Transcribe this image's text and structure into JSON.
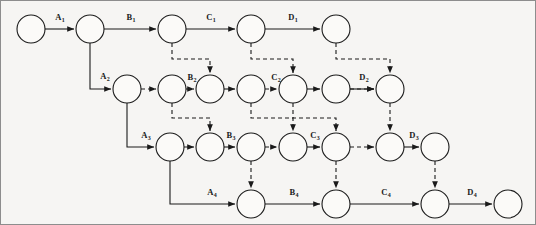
{
  "figure": {
    "title": "",
    "background_color": "#f6f5f3",
    "ink_color": "#1a1a1a",
    "frame_color": "#8d8d8d",
    "node_radius": 14,
    "node_fill": "#fbfaf8"
  },
  "chart_data": {
    "type": "diagram",
    "subtype": "activity-on-arrow network / pipeline flow-shop schedule graph",
    "title": "",
    "xlabel": "",
    "ylabel": "",
    "grid": false,
    "legend": "none",
    "rows": 4,
    "row_y": [
      29,
      89,
      147,
      204
    ],
    "nodes": [
      {
        "id": "n1-1",
        "row": 1,
        "x": 31,
        "y": 29
      },
      {
        "id": "n1-2",
        "row": 1,
        "x": 90,
        "y": 29
      },
      {
        "id": "n1-3",
        "row": 1,
        "x": 172,
        "y": 29
      },
      {
        "id": "n1-4",
        "row": 1,
        "x": 251,
        "y": 29
      },
      {
        "id": "n1-5",
        "row": 1,
        "x": 336,
        "y": 29
      },
      {
        "id": "n2-1",
        "row": 2,
        "x": 127,
        "y": 89
      },
      {
        "id": "n2-2",
        "row": 2,
        "x": 172,
        "y": 89
      },
      {
        "id": "n2-3",
        "row": 2,
        "x": 210,
        "y": 89
      },
      {
        "id": "n2-4",
        "row": 2,
        "x": 251,
        "y": 89
      },
      {
        "id": "n2-5",
        "row": 2,
        "x": 293,
        "y": 89
      },
      {
        "id": "n2-6",
        "row": 2,
        "x": 336,
        "y": 89
      },
      {
        "id": "n2-7",
        "row": 2,
        "x": 390,
        "y": 89
      },
      {
        "id": "n3-1",
        "row": 3,
        "x": 170,
        "y": 147
      },
      {
        "id": "n3-2",
        "row": 3,
        "x": 210,
        "y": 147
      },
      {
        "id": "n3-3",
        "row": 3,
        "x": 251,
        "y": 147
      },
      {
        "id": "n3-4",
        "row": 3,
        "x": 293,
        "y": 147
      },
      {
        "id": "n3-5",
        "row": 3,
        "x": 336,
        "y": 147
      },
      {
        "id": "n3-6",
        "row": 3,
        "x": 390,
        "y": 147
      },
      {
        "id": "n3-7",
        "row": 3,
        "x": 435,
        "y": 147
      },
      {
        "id": "n4-1",
        "row": 4,
        "x": 251,
        "y": 204
      },
      {
        "id": "n4-2",
        "row": 4,
        "x": 336,
        "y": 204
      },
      {
        "id": "n4-3",
        "row": 4,
        "x": 435,
        "y": 204
      },
      {
        "id": "n4-4",
        "row": 4,
        "x": 508,
        "y": 204
      }
    ],
    "solid_edges": [
      {
        "label": "A1",
        "from": "n1-1",
        "to": "n1-2",
        "label_x": 60,
        "label_y": 20
      },
      {
        "label": "B1",
        "from": "n1-2",
        "to": "n1-3",
        "label_x": 131,
        "label_y": 20
      },
      {
        "label": "C1",
        "from": "n1-3",
        "to": "n1-4",
        "label_x": 211,
        "label_y": 20
      },
      {
        "label": "D1",
        "from": "n1-4",
        "to": "n1-5",
        "label_x": 293,
        "label_y": 20
      },
      {
        "label": "A2",
        "from": "n1-2",
        "to": "n2-1",
        "label_x": 105,
        "label_y": 79,
        "elbow": true
      },
      {
        "label": "B2",
        "from": "n2-3",
        "to": "n2-4",
        "label_x": 192,
        "label_y": 80
      },
      {
        "label": "C2",
        "from": "n2-5",
        "to": "n2-6",
        "label_x": 276,
        "label_y": 80
      },
      {
        "label": "D2",
        "from": "n2-6",
        "to": "n2-7",
        "label_x": 364,
        "label_y": 80
      },
      {
        "label": "A3",
        "from": "n2-1",
        "to": "n3-1",
        "label_x": 146,
        "label_y": 138,
        "elbow": true
      },
      {
        "label": "B3",
        "from": "n3-2",
        "to": "n3-3",
        "label_x": 231,
        "label_y": 138
      },
      {
        "label": "C3",
        "from": "n3-4",
        "to": "n3-5",
        "label_x": 315,
        "label_y": 138
      },
      {
        "label": "D3",
        "from": "n3-6",
        "to": "n3-7",
        "label_x": 414,
        "label_y": 138
      },
      {
        "label": "A4",
        "from": "n3-1",
        "to": "n4-1",
        "label_x": 212,
        "label_y": 195,
        "elbow": true
      },
      {
        "label": "B4",
        "from": "n4-1",
        "to": "n4-2",
        "label_x": 294,
        "label_y": 195
      },
      {
        "label": "C4",
        "from": "n4-2",
        "to": "n4-3",
        "label_x": 386,
        "label_y": 195
      },
      {
        "label": "D4",
        "from": "n4-3",
        "to": "n4-4",
        "label_x": 472,
        "label_y": 195
      }
    ],
    "dashed_edges": [
      {
        "from": "n1-3",
        "to": "n2-3",
        "orientation": "vertical"
      },
      {
        "from": "n1-4",
        "to": "n2-5",
        "orientation": "vertical"
      },
      {
        "from": "n1-5",
        "to": "n2-7",
        "orientation": "vertical"
      },
      {
        "from": "n2-1",
        "to": "n2-2",
        "orientation": "horizontal"
      },
      {
        "from": "n2-2",
        "to": "n2-3",
        "orientation": "horizontal"
      },
      {
        "from": "n2-4",
        "to": "n2-5",
        "orientation": "horizontal"
      },
      {
        "from": "n2-6",
        "to": "n2-7",
        "orientation": "horizontal"
      },
      {
        "from": "n2-2",
        "to": "n3-2",
        "orientation": "vertical"
      },
      {
        "from": "n2-4",
        "to": "n3-4",
        "orientation": "vertical"
      },
      {
        "from": "n2-5",
        "to": "n3-5",
        "orientation": "vertical"
      },
      {
        "from": "n2-7",
        "to": "n3-6",
        "orientation": "vertical"
      },
      {
        "from": "n3-1",
        "to": "n3-2",
        "orientation": "horizontal"
      },
      {
        "from": "n3-3",
        "to": "n3-4",
        "orientation": "horizontal"
      },
      {
        "from": "n3-5",
        "to": "n3-6",
        "orientation": "horizontal"
      },
      {
        "from": "n3-3",
        "to": "n4-1",
        "orientation": "vertical"
      },
      {
        "from": "n3-5",
        "to": "n4-2",
        "orientation": "vertical"
      },
      {
        "from": "n3-7",
        "to": "n4-3",
        "orientation": "vertical"
      }
    ],
    "labels": [
      "A1",
      "B1",
      "C1",
      "D1",
      "A2",
      "B2",
      "C2",
      "D2",
      "A3",
      "B3",
      "C3",
      "D3",
      "A4",
      "B4",
      "C4",
      "D4"
    ],
    "label_text": {
      "A1": {
        "base": "A",
        "sub": "1"
      },
      "B1": {
        "base": "B",
        "sub": "1"
      },
      "C1": {
        "base": "C",
        "sub": "1"
      },
      "D1": {
        "base": "D",
        "sub": "1"
      },
      "A2": {
        "base": "A",
        "sub": "2"
      },
      "B2": {
        "base": "B",
        "sub": "2"
      },
      "C2": {
        "base": "C",
        "sub": "2"
      },
      "D2": {
        "base": "D",
        "sub": "2"
      },
      "A3": {
        "base": "A",
        "sub": "3"
      },
      "B3": {
        "base": "B",
        "sub": "3"
      },
      "C3": {
        "base": "C",
        "sub": "3"
      },
      "D3": {
        "base": "D",
        "sub": "3"
      },
      "A4": {
        "base": "A",
        "sub": "4"
      },
      "B4": {
        "base": "B",
        "sub": "4"
      },
      "C4": {
        "base": "C",
        "sub": "4"
      },
      "D4": {
        "base": "D",
        "sub": "4"
      }
    }
  }
}
